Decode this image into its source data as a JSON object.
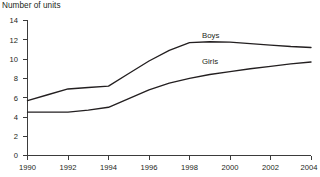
{
  "chart_data": {
    "type": "line",
    "title": "Number of units",
    "xlabel": "",
    "ylabel": "",
    "ylim": [
      0,
      14
    ],
    "xlim": [
      1990,
      2004
    ],
    "yticks": [
      0,
      2,
      4,
      6,
      8,
      10,
      12,
      14
    ],
    "xticks": [
      1990,
      1992,
      1994,
      1996,
      1998,
      2000,
      2002,
      2004
    ],
    "grid": false,
    "legend_position": "inline-above-line",
    "x": [
      1990,
      1991,
      1992,
      1993,
      1994,
      1995,
      1996,
      1997,
      1998,
      1999,
      2000,
      2001,
      2002,
      2003,
      2004
    ],
    "series": [
      {
        "name": "Boys",
        "label": "Boys",
        "values": [
          5.7,
          6.3,
          6.9,
          7.05,
          7.2,
          8.5,
          9.8,
          10.9,
          11.7,
          11.8,
          11.75,
          11.6,
          11.45,
          11.3,
          11.2
        ]
      },
      {
        "name": "Girls",
        "label": "Girls",
        "values": [
          4.5,
          4.5,
          4.5,
          4.7,
          5.0,
          5.9,
          6.8,
          7.5,
          8.0,
          8.4,
          8.7,
          9.0,
          9.25,
          9.5,
          9.7
        ]
      }
    ],
    "colors": {
      "line": "#231f20",
      "axis": "#3b3b3b",
      "background": "#ffffff"
    }
  },
  "axis": {
    "y_tick_labels": [
      "14",
      "12",
      "10",
      "8",
      "6",
      "4",
      "2",
      "0"
    ],
    "x_tick_labels": [
      "1990",
      "1992",
      "1994",
      "1996",
      "1998",
      "2000",
      "2002",
      "2004"
    ]
  },
  "labels": {
    "boys": "Boys",
    "girls": "Girls"
  }
}
